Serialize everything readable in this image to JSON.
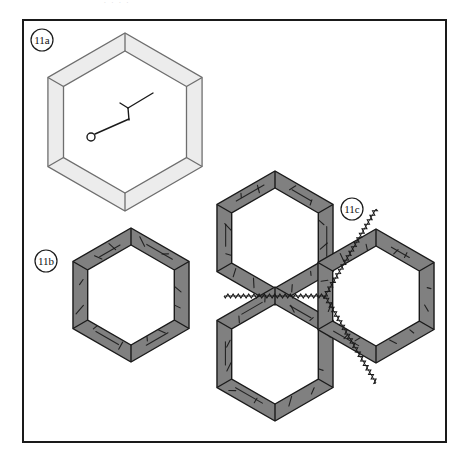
{
  "figure": {
    "kind": "patent-line-drawing",
    "frame": {
      "stroke": "#1a1a1a",
      "fill": "#ffffff",
      "x": 22,
      "y": 19,
      "w": 425,
      "h": 424
    },
    "ghost_text": ". .                                                     .        .",
    "palette": {
      "outline": "#1a1a1a",
      "band_light": "#ececec",
      "band_light_edge": "#6e6e6e",
      "band_dark": "#808080",
      "band_dark_edge": "#1a1a1a",
      "page": "#ffffff",
      "hatch": "#1a1a1a",
      "label_text": "#111111"
    },
    "labels": [
      {
        "id": "label-11a",
        "text": "11a",
        "cx": 42,
        "cy": 40,
        "r": 11
      },
      {
        "id": "label-11b",
        "text": "11b",
        "cx": 46,
        "cy": 261,
        "r": 11
      },
      {
        "id": "label-11c",
        "text": "11c",
        "cx": 352,
        "cy": 209,
        "r": 11
      }
    ],
    "parts": [
      {
        "id": "part-11a",
        "label": "11a",
        "style": "light",
        "description": "single light-gray hexagonal ring frame with interior pointer annotations",
        "cx": 125,
        "cy": 122,
        "outer_r": 89,
        "inner_r": 71,
        "rotation": 30
      },
      {
        "id": "part-11b",
        "label": "11b",
        "style": "dark",
        "description": "single dark-gray hexagonal ring frame",
        "cx": 131,
        "cy": 295,
        "outer_r": 67,
        "inner_r": 50,
        "rotation": 30
      },
      {
        "id": "part-11c",
        "label": "11c",
        "style": "dark",
        "description": "cluster of three dark-gray hexagonal ring frames joined by welded seams",
        "cells": [
          {
            "name": "cell-upper-left",
            "cx": 275,
            "cy": 238,
            "outer_r": 67,
            "inner_r": 50
          },
          {
            "name": "cell-lower-left",
            "cx": 275,
            "cy": 354,
            "outer_r": 67,
            "inner_r": 50
          },
          {
            "name": "cell-right",
            "cx": 376,
            "cy": 296,
            "outer_r": 67,
            "inner_r": 50
          }
        ],
        "seams": [
          {
            "name": "seam-horizontal",
            "x1": 224,
            "y1": 296,
            "x2": 325,
            "y2": 296
          },
          {
            "name": "seam-upper-diagonal",
            "x1": 325,
            "y1": 296,
            "x2": 376,
            "y2": 209
          },
          {
            "name": "seam-lower-diagonal",
            "x1": 325,
            "y1": 296,
            "x2": 376,
            "y2": 383
          }
        ]
      }
    ],
    "annotations": [
      {
        "name": "pin-pointer",
        "part": "11a",
        "description": "straight leader line ending in a small open circle",
        "circle": {
          "cx": 91,
          "cy": 137,
          "r": 4
        },
        "line": {
          "x1": 95,
          "y1": 134,
          "x2": 129,
          "y2": 119
        }
      },
      {
        "name": "y-arrow-pointer",
        "part": "11a",
        "description": "Y shaped fork mark with a leader line running up-right",
        "stem": {
          "x1": 129,
          "y1": 120,
          "x2": 128,
          "y2": 108
        },
        "fork_left": {
          "x1": 128,
          "y1": 108,
          "x2": 120,
          "y2": 103
        },
        "fork_right": {
          "x1": 128,
          "y1": 108,
          "x2": 153,
          "y2": 93
        }
      }
    ]
  }
}
